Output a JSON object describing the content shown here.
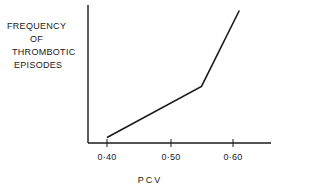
{
  "chart_data": {
    "type": "line",
    "title": "",
    "xlabel": "PCV",
    "ylabel": "FREQUENCY OF THROMBOTIC EPISODES",
    "ylabel_lines": [
      "FREQUENCY",
      "OF",
      "THROMBOTIC",
      "EPISODES"
    ],
    "x_ticks": [
      "0·40",
      "0·50",
      "0·60"
    ],
    "x_tick_values": [
      0.4,
      0.5,
      0.6
    ],
    "xlim": [
      0.4,
      0.66
    ],
    "ylim": [
      0,
      100
    ],
    "y_ticks": [],
    "grid": false,
    "legend": null,
    "series": [
      {
        "name": "Thrombotic episode frequency",
        "x": [
          0.4,
          0.55,
          0.61
        ],
        "y": [
          4,
          41,
          96
        ]
      }
    ],
    "annotations": []
  }
}
